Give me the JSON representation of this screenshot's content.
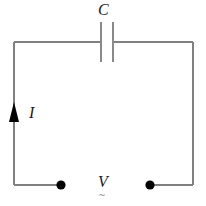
{
  "figure": {
    "kind": "circuit-diagram",
    "title_text": "",
    "width": 206,
    "height": 206,
    "background_color": "#ffffff"
  },
  "style": {
    "wire_color": "#808080",
    "wire_width": 1.2,
    "plate_color": "#8a8a8a",
    "plate_width": 1.4,
    "marker_color": "#000000",
    "label_color": "#1a1a1a",
    "tilde_color": "#5a5a5a"
  },
  "labels": {
    "capacitor": "C",
    "current": "I",
    "voltage": "V",
    "ac_source_symbol": "~"
  },
  "components": {
    "capacitor": {
      "name": "capacitor",
      "label": "C",
      "plate_left_x": 101,
      "plate_right_x": 113,
      "plate_top_y": 22,
      "plate_bottom_y": 62
    },
    "current_arrow": {
      "name": "current-arrow",
      "label": "I",
      "direction": "up",
      "x": 14,
      "tip_y": 102,
      "base_y": 122,
      "half_width": 5
    },
    "source_terminals": [
      {
        "name": "terminal-left",
        "x": 61,
        "y": 185,
        "radius": 4.6,
        "filled": true
      },
      {
        "name": "terminal-right",
        "x": 150,
        "y": 185,
        "radius": 4.6,
        "filled": true
      }
    ]
  },
  "geometry": {
    "left_x": 14,
    "right_x": 193,
    "top_y": 42,
    "bottom_y": 185,
    "top_wire_left_end_x": 101,
    "top_wire_right_start_x": 113
  }
}
